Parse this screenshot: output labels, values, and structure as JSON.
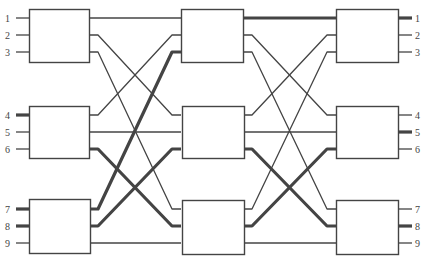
{
  "diagram": {
    "type": "three-stage-clos-network",
    "colors": {
      "line": "#444444",
      "box_stroke": "#444444",
      "box_fill": "#ffffff",
      "label": "#444444"
    },
    "input_labels": [
      "1",
      "2",
      "3",
      "4",
      "5",
      "6",
      "7",
      "8",
      "9"
    ],
    "output_labels": [
      "1",
      "2",
      "3",
      "4",
      "5",
      "6",
      "7",
      "8",
      "9"
    ],
    "stages": [
      {
        "name": "ingress",
        "boxes": [
          {
            "x": 29,
            "y": 9,
            "w": 60,
            "h": 53
          },
          {
            "x": 29,
            "y": 106,
            "w": 60,
            "h": 52
          },
          {
            "x": 29,
            "y": 199,
            "w": 61,
            "h": 54
          }
        ]
      },
      {
        "name": "middle",
        "boxes": [
          {
            "x": 181,
            "y": 9,
            "w": 62,
            "h": 53
          },
          {
            "x": 182,
            "y": 106,
            "w": 62,
            "h": 52
          },
          {
            "x": 182,
            "y": 200,
            "w": 62,
            "h": 54
          }
        ]
      },
      {
        "name": "egress",
        "boxes": [
          {
            "x": 336,
            "y": 9,
            "w": 62,
            "h": 53
          },
          {
            "x": 336,
            "y": 106,
            "w": 62,
            "h": 52
          },
          {
            "x": 336,
            "y": 200,
            "w": 62,
            "h": 54
          }
        ]
      }
    ],
    "port_rows": [
      18,
      35,
      52,
      115,
      132,
      149,
      209,
      226,
      243
    ],
    "highlighted_inputs": [
      "4",
      "7",
      "8"
    ],
    "highlighted_outputs": [
      "1",
      "5",
      "8"
    ],
    "inputs": [
      {
        "label": "1",
        "y": 18,
        "thick": false
      },
      {
        "label": "2",
        "y": 35,
        "thick": false
      },
      {
        "label": "3",
        "y": 52,
        "thick": false
      },
      {
        "label": "4",
        "y": 115,
        "thick": true
      },
      {
        "label": "5",
        "y": 132,
        "thick": false
      },
      {
        "label": "6",
        "y": 149,
        "thick": false
      },
      {
        "label": "7",
        "y": 209,
        "thick": true
      },
      {
        "label": "8",
        "y": 226,
        "thick": true
      },
      {
        "label": "9",
        "y": 243,
        "thick": false
      }
    ],
    "outputs": [
      {
        "label": "1",
        "y": 18,
        "thick": true
      },
      {
        "label": "2",
        "y": 35,
        "thick": false
      },
      {
        "label": "3",
        "y": 52,
        "thick": false
      },
      {
        "label": "4",
        "y": 115,
        "thick": false
      },
      {
        "label": "5",
        "y": 132,
        "thick": true
      },
      {
        "label": "6",
        "y": 149,
        "thick": false
      },
      {
        "label": "7",
        "y": 209,
        "thick": false
      },
      {
        "label": "8",
        "y": 226,
        "thick": true
      },
      {
        "label": "9",
        "y": 243,
        "thick": false
      }
    ],
    "links_stage1_to_2": [
      {
        "from_y": 18,
        "to_y": 18,
        "thick": false
      },
      {
        "from_y": 35,
        "to_y": 115,
        "thick": false
      },
      {
        "from_y": 52,
        "to_y": 209,
        "thick": false
      },
      {
        "from_y": 115,
        "to_y": 35,
        "thick": false
      },
      {
        "from_y": 132,
        "to_y": 132,
        "thick": false
      },
      {
        "from_y": 149,
        "to_y": 226,
        "thick": true
      },
      {
        "from_y": 209,
        "to_y": 52,
        "thick": true
      },
      {
        "from_y": 226,
        "to_y": 149,
        "thick": true
      },
      {
        "from_y": 243,
        "to_y": 243,
        "thick": false
      }
    ],
    "links_stage2_to_3": [
      {
        "from_y": 18,
        "to_y": 18,
        "thick": true
      },
      {
        "from_y": 35,
        "to_y": 115,
        "thick": false
      },
      {
        "from_y": 52,
        "to_y": 209,
        "thick": false
      },
      {
        "from_y": 115,
        "to_y": 35,
        "thick": false
      },
      {
        "from_y": 132,
        "to_y": 132,
        "thick": false
      },
      {
        "from_y": 149,
        "to_y": 226,
        "thick": true
      },
      {
        "from_y": 209,
        "to_y": 52,
        "thick": false
      },
      {
        "from_y": 226,
        "to_y": 149,
        "thick": true
      },
      {
        "from_y": 243,
        "to_y": 243,
        "thick": false
      }
    ]
  }
}
